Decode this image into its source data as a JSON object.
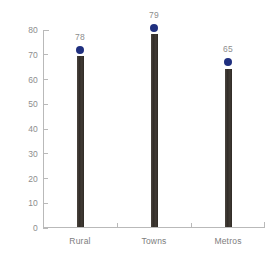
{
  "chart_data": {
    "type": "bar",
    "title": "",
    "xlabel": "",
    "ylabel": "",
    "categories": [
      "Rural",
      "Towns",
      "Metros"
    ],
    "values": [
      69,
      78,
      64
    ],
    "ylim": [
      0,
      80
    ],
    "yticks": [
      0,
      10,
      20,
      30,
      40,
      50,
      60,
      70,
      80
    ],
    "ytick_labels": [
      "0",
      "10",
      "20",
      "30",
      "40",
      "50",
      "60",
      "70",
      "80"
    ],
    "grid": false,
    "legend_position": "none",
    "series": [
      {
        "name": "bar-series",
        "type": "bar",
        "values": [
          69,
          78,
          64
        ]
      },
      {
        "name": "marker-series",
        "type": "scatter",
        "values": [
          72,
          81,
          67
        ],
        "data_labels": [
          "78",
          "79",
          "65"
        ]
      }
    ],
    "data_labels": [
      "78",
      "79",
      "65"
    ],
    "colors": {
      "bar": "#3a3430",
      "marker": "#1f2f7f",
      "axis": "#b9b9b9",
      "tick_label": "#8d8d8d",
      "category_label": "#7d7d7d",
      "background": "#ffffff"
    }
  },
  "axis": {
    "y_tick_labels": [
      "80",
      "70",
      "60",
      "50",
      "40",
      "30",
      "20",
      "10",
      "0"
    ]
  },
  "categories": [
    {
      "label": "Rural",
      "value_label": "78"
    },
    {
      "label": "Towns",
      "value_label": "79"
    },
    {
      "label": "Metros",
      "value_label": "65"
    }
  ]
}
